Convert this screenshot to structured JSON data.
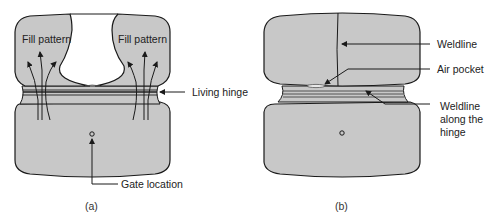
{
  "figure": {
    "panel_a": {
      "caption": "(a)",
      "labels": {
        "fill_pattern_left": "Fill pattern",
        "fill_pattern_right": "Fill pattern",
        "living_hinge": "Living hinge",
        "gate_location": "Gate location"
      }
    },
    "panel_b": {
      "caption": "(b)",
      "labels": {
        "weldline": "Weldline",
        "air_pocket": "Air pocket",
        "weldline_hinge_1": "Weldline",
        "weldline_hinge_2": "along the",
        "weldline_hinge_3": "hinge"
      }
    },
    "colors": {
      "part_fill": "#c8c8c8",
      "outline": "#1a1a1a",
      "background": "#ffffff"
    }
  }
}
